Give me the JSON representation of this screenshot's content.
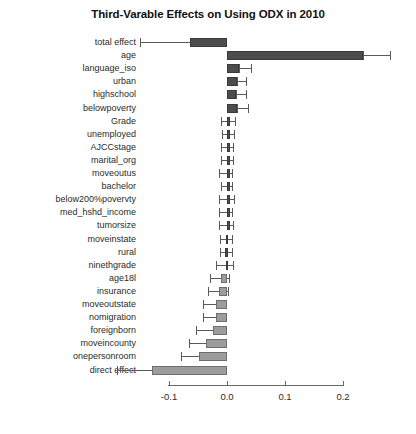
{
  "chart_data": {
    "type": "bar",
    "orientation": "horizontal",
    "title": "Third-Varable Effects on Using ODX in 2010",
    "xlabel": "",
    "ylabel": "",
    "xlim": [
      -0.2,
      0.29
    ],
    "xticks": [
      -0.1,
      0.0,
      0.1,
      0.2
    ],
    "xtick_labels": [
      "-0.1",
      "0.0",
      "0.1",
      "0.2"
    ],
    "grid": false,
    "legend": null,
    "zero_reference": 0.0,
    "categories": [
      "total effect",
      "age",
      "language_iso",
      "urban",
      "highschool",
      "belowpoverty",
      "Grade",
      "unemployed",
      "AJCCstage",
      "marital_org",
      "moveoutus",
      "bachelor",
      "below200%povervty",
      "med_hshd_income",
      "tumorsize",
      "moveinstate",
      "rural",
      "ninethgrade",
      "age18l",
      "insurance",
      "moveoutstate",
      "nomigration",
      "foreignborn",
      "moveincounty",
      "onepersonroom",
      "direct effect"
    ],
    "values": [
      -0.064,
      0.234,
      0.02,
      0.017,
      0.016,
      0.018,
      0.004,
      0.006,
      0.003,
      0.002,
      0.001,
      0.001,
      0.002,
      0.001,
      0.001,
      -0.002,
      -0.003,
      -0.002,
      -0.01,
      -0.014,
      -0.019,
      -0.019,
      -0.024,
      -0.036,
      -0.048,
      -0.13
    ],
    "ci_low": [
      -0.15,
      0.234,
      0.02,
      0.017,
      0.016,
      0.018,
      -0.011,
      -0.008,
      -0.011,
      -0.01,
      -0.013,
      -0.011,
      -0.014,
      -0.013,
      -0.014,
      -0.012,
      -0.012,
      -0.019,
      -0.029,
      -0.033,
      -0.041,
      -0.041,
      -0.053,
      -0.065,
      -0.079,
      -0.19
    ],
    "ci_high": [
      -0.064,
      0.281,
      0.041,
      0.033,
      0.033,
      0.036,
      0.013,
      0.012,
      0.01,
      0.01,
      0.009,
      0.009,
      0.012,
      0.009,
      0.011,
      0.008,
      0.008,
      0.011,
      0.003,
      0.001,
      -0.002,
      -0.002,
      -0.006,
      -0.013,
      -0.022,
      -0.059
    ],
    "bar_colors": [
      "dark",
      "dark",
      "dark",
      "dark",
      "dark",
      "dark",
      "dark",
      "dark",
      "dark",
      "dark",
      "dark",
      "dark",
      "dark",
      "dark",
      "dark",
      "dark",
      "dark",
      "dark",
      "light",
      "light",
      "light",
      "light",
      "light",
      "light",
      "light",
      "light"
    ],
    "colors": {
      "dark_bar": "#4d4d4d",
      "light_bar": "#9c9c9c",
      "error_bar": "#5a5a5a",
      "axis": "#6a6a6a",
      "text": "#2b2b2b",
      "background": "#ffffff"
    }
  }
}
